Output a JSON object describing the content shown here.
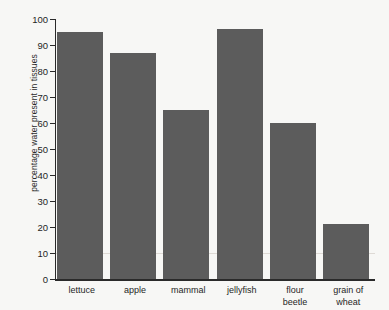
{
  "chart_data": {
    "type": "bar",
    "title": "",
    "xlabel": "",
    "ylabel": "percentage water present in tissues",
    "categories": [
      "lettuce",
      "apple",
      "mammal",
      "jellyfish",
      "flour beetle",
      "grain of wheat"
    ],
    "values": [
      95,
      87,
      65,
      96,
      60,
      21
    ],
    "ylim": [
      0,
      100
    ],
    "yticks": [
      0,
      10,
      20,
      30,
      40,
      50,
      60,
      70,
      80,
      90,
      100
    ],
    "ytick_labels": [
      "0",
      "10",
      "20",
      "30",
      "40",
      "50",
      "60",
      "70",
      "80",
      "90",
      "100"
    ],
    "grid": "single faint horizontal line at y = 10",
    "gridlines": [
      10
    ],
    "legend": "none",
    "bar_color": "#5c5c5c",
    "axis_color": "#2a2a2a",
    "background_color": "#f7f7f5"
  },
  "category_label_lines": [
    [
      "lettuce"
    ],
    [
      "apple"
    ],
    [
      "mammal"
    ],
    [
      "jellyfish"
    ],
    [
      "flour",
      "beetle"
    ],
    [
      "grain of",
      "wheat"
    ]
  ]
}
